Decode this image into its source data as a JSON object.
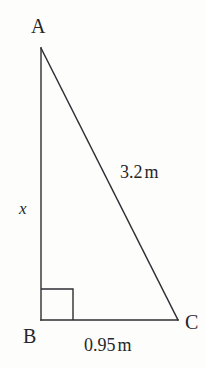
{
  "figure": {
    "type": "right-triangle-diagram",
    "background_color": "#fdfdfc",
    "stroke_color": "#2e2e33",
    "text_color": "#26262a",
    "vertices": {
      "a": {
        "label": "A",
        "x": 41,
        "y": 48
      },
      "b": {
        "label": "B",
        "x": 41,
        "y": 320
      },
      "c": {
        "label": "C",
        "x": 178,
        "y": 320
      }
    },
    "right_angle": {
      "at_vertex": "B",
      "marker_size": 32
    },
    "sides": {
      "ab": {
        "label": "x",
        "value": "x",
        "unit": "",
        "known": false
      },
      "ac": {
        "label": "3.2 m",
        "value": "3.2",
        "unit": "m",
        "known": true
      },
      "bc": {
        "label": "0.95 m",
        "value": "0.95",
        "unit": "m",
        "known": true
      }
    }
  }
}
